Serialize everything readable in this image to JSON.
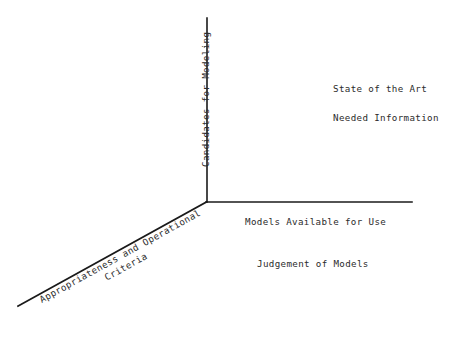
{
  "diagram": {
    "type": "axes-diagram",
    "background_color": "#ffffff",
    "line_color": "#1a1a1a",
    "text_color": "#2b2b2b",
    "axes": {
      "origin": {
        "x": 206,
        "y": 202
      },
      "vertical": {
        "name": "candidates-for-modeling-axis",
        "label": "Candidates for Modeling",
        "from": {
          "x": 207,
          "y": 18
        },
        "to": {
          "x": 207,
          "y": 202
        },
        "rotation_deg": -90
      },
      "horizontal": {
        "name": "models-available-for-use-axis",
        "label": "Models Available for Use",
        "from": {
          "x": 206,
          "y": 202
        },
        "to": {
          "x": 412,
          "y": 202
        },
        "rotation_deg": 0
      },
      "diagonal": {
        "name": "appropriateness-criteria-axis",
        "label_line1": "Appropriateness and Operational",
        "label_line2": "Criteria",
        "from": {
          "x": 206,
          "y": 202
        },
        "to": {
          "x": 18,
          "y": 306
        },
        "rotation_deg": -28.9
      }
    },
    "annotations": [
      {
        "name": "state-of-the-art",
        "text": "State of the Art"
      },
      {
        "name": "needed-information",
        "text": "Needed Information"
      },
      {
        "name": "judgement-of-models",
        "text": "Judgement of Models"
      }
    ]
  }
}
